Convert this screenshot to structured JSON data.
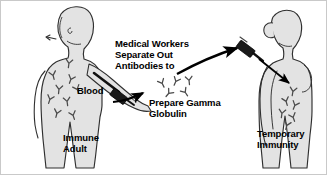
{
  "diagram": {
    "background_color": "#ffffff",
    "border_color": "#c9c9c9",
    "body_fill": "#e3e3e3",
    "body_stroke": "#3a3a3a",
    "antibody_color": "#4a4a4a",
    "arrow_color": "#000000",
    "syringe_color": "#1a1a1a",
    "labels": {
      "immune_adult": "Immune\nAdult",
      "temporary_immunity": "Temporary\nImmunity",
      "blood": "Blood",
      "center_top": "Medical Workers\nSeparate Out\nAntibodies to",
      "center_bottom": "Prepare Gamma\nGlobulin"
    },
    "figures": [
      {
        "name": "immune-adult-figure",
        "label": "Immune Adult",
        "side": "left",
        "antibody_count": 9,
        "has_syringe": true,
        "syringe_location": "left-arm-vein"
      },
      {
        "name": "temporary-immunity-figure",
        "label": "Temporary Immunity",
        "side": "right",
        "antibody_count": 6,
        "has_syringe": true,
        "syringe_location": "shoulder"
      }
    ],
    "antibody_cluster": {
      "name": "gamma-globulin-antibodies",
      "count": 5
    },
    "arrows": [
      {
        "name": "blood-to-gamma-globulin-arrow",
        "from": "blood-draw",
        "to": "antibody-cluster"
      },
      {
        "name": "gamma-globulin-to-recipient-arrow",
        "from": "antibody-cluster",
        "to": "recipient-shoulder"
      },
      {
        "name": "injection-into-body-arrow",
        "from": "shoulder-syringe",
        "to": "recipient-torso"
      }
    ]
  }
}
